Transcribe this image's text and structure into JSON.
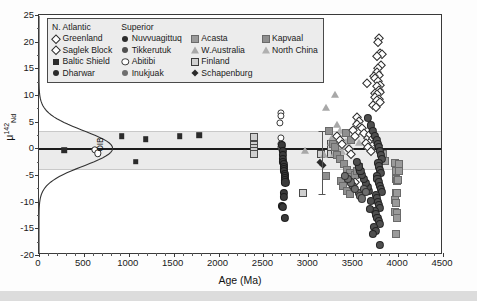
{
  "chart_data": {
    "type": "scatter",
    "title": "",
    "xlabel": "Age (Ma)",
    "ylabel": "μ142Nd",
    "ylabel_parts": {
      "mu": "μ",
      "sup": "142",
      "sub": "Nd"
    },
    "xlim": [
      0,
      4500
    ],
    "ylim": [
      -20,
      25
    ],
    "xticks": [
      0,
      500,
      1000,
      1500,
      2000,
      2500,
      3000,
      3500,
      4000,
      4500
    ],
    "xtick_labels": [
      "0",
      "500",
      "1000",
      "1500",
      "2000",
      "2500",
      "3000",
      "3500",
      "4000",
      "4500"
    ],
    "yticks": [
      -20,
      -15,
      -10,
      -5,
      0,
      5,
      10,
      15,
      20,
      25
    ],
    "ytick_labels": [
      "-20",
      "-15",
      "-10",
      "-5",
      "0",
      "5",
      "10",
      "15",
      "20",
      "25"
    ],
    "grid": false,
    "zero_line": 0,
    "reference_band": {
      "label": "modern mantle band",
      "upper": 3.3,
      "lower": -3.8,
      "color": "#e8e8e8"
    },
    "annotations": [
      {
        "text": "OIB",
        "x": 700,
        "y": 0.2,
        "rotation": -90
      }
    ],
    "error_bar": {
      "x": 3150,
      "y": -3.0,
      "upper": 3.3,
      "lower": -8.6
    },
    "density_curve": {
      "name": "OIB distribution",
      "description": "Gaussian kernel density of modern OIB plotted sideways at left axis, peak near 800 Ma equivalent width centred on mu = 0",
      "center": 0.0,
      "sigma": 3.3,
      "peak_x": 820
    },
    "legend": {
      "position": "upper-left-inside",
      "columns": [
        {
          "header": "N. Atlantic",
          "items": [
            {
              "label": "Greenland",
              "marker": "diamond-open",
              "color": "#ffffff",
              "edge": "#2b2b2b"
            },
            {
              "label": "Saglek Block",
              "marker": "diamond-open",
              "color": "#ffffff",
              "edge": "#2b2b2b"
            },
            {
              "label": "Baltic Shield",
              "marker": "square-filled",
              "color": "#2b2b2b",
              "edge": "#2b2b2b"
            },
            {
              "label": "Dharwar",
              "marker": "circle-filled",
              "color": "#2b2b2b",
              "edge": "#2b2b2b"
            }
          ]
        },
        {
          "header": "Superior",
          "items": [
            {
              "label": "Nuvvuagittuq",
              "marker": "circle-filled",
              "color": "#2b2b2b",
              "edge": "#2b2b2b"
            },
            {
              "label": "Tikkerutuk",
              "marker": "circle-filled",
              "color": "#4f4f4f",
              "edge": "#3a3a3a"
            },
            {
              "label": "Abitibi",
              "marker": "circle-open",
              "color": "#ffffff",
              "edge": "#3a3a3a"
            },
            {
              "label": "Inukjuak",
              "marker": "circle-filled",
              "color": "#6e6e6e",
              "edge": "#4a4a4a"
            }
          ]
        },
        {
          "header": "",
          "items": [
            {
              "label": "Acasta",
              "marker": "square-gray",
              "color": "#9a9a9a",
              "edge": "#6a6a6a"
            },
            {
              "label": "W.Australia",
              "marker": "triangle-gray",
              "color": "#a8a8a8",
              "edge": "#7a7a7a"
            },
            {
              "label": "Finland",
              "marker": "square-hatched",
              "color": "#cfcfcf",
              "edge": "#4a4a4a"
            },
            {
              "label": "Schapenburg",
              "marker": "diamond-filled",
              "color": "#2b2b2b",
              "edge": "#2b2b2b"
            }
          ]
        },
        {
          "header": "",
          "items": [
            {
              "label": "Kapvaal",
              "marker": "square-gray",
              "color": "#8f8f8f",
              "edge": "#6a6a6a"
            },
            {
              "label": "North China",
              "marker": "triangle-gray",
              "color": "#b0b0b0",
              "edge": "#7a7a7a"
            }
          ]
        }
      ]
    },
    "series": [
      {
        "name": "Baltic Shield",
        "marker": "square-filled",
        "color": "#2b2b2b",
        "points": [
          [
            283,
            -0.4
          ],
          [
            920,
            2.3
          ],
          [
            1190,
            1.7
          ],
          [
            1565,
            2.3
          ],
          [
            1785,
            2.5
          ],
          [
            1075,
            -2.5
          ]
        ]
      },
      {
        "name": "Dharwar",
        "marker": "circle-open-small",
        "color": "#ffffff",
        "points": [
          [
            620,
            -0.3
          ],
          [
            655,
            -0.9
          ]
        ]
      },
      {
        "name": "Finland",
        "marker": "square-hatched",
        "color": "#cfcfcf",
        "points": [
          [
            2395,
            2.2
          ],
          [
            2395,
            0.7
          ],
          [
            2395,
            0.1
          ],
          [
            2400,
            -0.5
          ],
          [
            2400,
            -1.0
          ],
          [
            2940,
            -8.3
          ],
          [
            3250,
            0.9
          ],
          [
            3250,
            -0.1
          ],
          [
            3255,
            -1.1
          ],
          [
            3140,
            -1.1
          ],
          [
            3300,
            0.4
          ],
          [
            3300,
            -0.6
          ]
        ]
      },
      {
        "name": "Abitibi",
        "marker": "circle-open",
        "color": "#ffffff",
        "points": [
          [
            2690,
            6.6
          ],
          [
            2690,
            6.1
          ],
          [
            2685,
            4.7
          ],
          [
            2690,
            2.0
          ],
          [
            2695,
            0.9
          ],
          [
            2700,
            0.3
          ],
          [
            2705,
            -0.2
          ]
        ]
      },
      {
        "name": "Nuvvuagittuq",
        "marker": "circle-filled",
        "color": "#3a3a3a",
        "points": [
          [
            2710,
            0.6
          ],
          [
            2715,
            -0.5
          ],
          [
            2715,
            -1.3
          ],
          [
            2720,
            -2.0
          ],
          [
            2720,
            -2.6
          ],
          [
            2725,
            -3.0
          ],
          [
            2725,
            -3.5
          ],
          [
            2730,
            -3.9
          ],
          [
            2730,
            -4.3
          ],
          [
            2735,
            -4.8
          ],
          [
            2735,
            -5.2
          ],
          [
            2740,
            -5.6
          ],
          [
            2740,
            -6.0
          ],
          [
            2745,
            -6.4
          ],
          [
            2725,
            -8.4
          ],
          [
            2725,
            -9.1
          ],
          [
            2710,
            -10.8
          ],
          [
            2720,
            -11.0
          ],
          [
            2735,
            -13.1
          ]
        ]
      },
      {
        "name": "W.Australia",
        "marker": "triangle-gray",
        "color": "#a8a8a8",
        "points": [
          [
            3300,
            10.0
          ],
          [
            3200,
            7.5
          ],
          [
            3320,
            4.3
          ],
          [
            3260,
            2.0
          ],
          [
            3250,
            1.0
          ],
          [
            3330,
            -0.5
          ],
          [
            3290,
            -1.1
          ],
          [
            3180,
            -1.2
          ],
          [
            3345,
            -1.0
          ],
          [
            2960,
            -0.5
          ]
        ]
      },
      {
        "name": "North China",
        "marker": "triangle-gray",
        "color": "#b0b0b0",
        "points": [
          [
            3350,
            3.2
          ],
          [
            3360,
            1.4
          ],
          [
            3370,
            0.3
          ],
          [
            3380,
            -0.7
          ],
          [
            3420,
            1.2
          ],
          [
            3450,
            0.4
          ],
          [
            3500,
            2.2
          ],
          [
            3560,
            1.0
          ]
        ]
      },
      {
        "name": "Acasta",
        "marker": "square-gray",
        "color": "#9a9a9a",
        "points": [
          [
            3960,
            -2.8
          ],
          [
            3975,
            -4.2
          ],
          [
            3980,
            -5.8
          ],
          [
            3985,
            -6.2
          ],
          [
            4000,
            -6.0
          ],
          [
            3975,
            -8.4
          ],
          [
            3990,
            -8.3
          ],
          [
            3970,
            -9.6
          ],
          [
            3975,
            -10.3
          ],
          [
            3970,
            -12.0
          ],
          [
            3990,
            -12.1
          ],
          [
            3985,
            -13.0
          ],
          [
            3975,
            -16.0
          ],
          [
            4010,
            -4.2
          ],
          [
            4005,
            -3.0
          ],
          [
            3830,
            -1.0
          ],
          [
            3850,
            -2.4
          ]
        ]
      },
      {
        "name": "Kapvaal",
        "marker": "square-gray",
        "color": "#8f8f8f",
        "points": [
          [
            3200,
            -5.1
          ],
          [
            3280,
            0.9
          ],
          [
            3300,
            0.2
          ],
          [
            3320,
            -1.2
          ],
          [
            3350,
            -2.0
          ],
          [
            3400,
            -3.0
          ],
          [
            3430,
            -4.0
          ],
          [
            3460,
            -4.6
          ],
          [
            3480,
            -5.4
          ],
          [
            3500,
            -6.0
          ],
          [
            3520,
            -5.0
          ],
          [
            3540,
            -4.3
          ],
          [
            3560,
            -3.5
          ],
          [
            3230,
            3.2
          ],
          [
            3420,
            2.8
          ],
          [
            3470,
            1.6
          ],
          [
            3360,
            -6.2
          ],
          [
            3390,
            -7.0
          ],
          [
            3430,
            -8.0
          ],
          [
            3460,
            -8.6
          ]
        ]
      },
      {
        "name": "Greenland",
        "marker": "diamond-open",
        "color": "#ffffff",
        "points": [
          [
            3790,
            20.6
          ],
          [
            3775,
            20.0
          ],
          [
            3800,
            17.8
          ],
          [
            3815,
            17.6
          ],
          [
            3760,
            17.3
          ],
          [
            3810,
            15.6
          ],
          [
            3780,
            15.1
          ],
          [
            3760,
            14.3
          ],
          [
            3790,
            13.8
          ],
          [
            3735,
            13.5
          ],
          [
            3745,
            13.2
          ],
          [
            3780,
            12.6
          ],
          [
            3650,
            12.2
          ],
          [
            3800,
            11.9
          ],
          [
            3760,
            11.6
          ],
          [
            3790,
            11.0
          ],
          [
            3800,
            10.6
          ],
          [
            3740,
            10.4
          ],
          [
            3770,
            10.2
          ],
          [
            3745,
            9.6
          ],
          [
            3790,
            9.3
          ],
          [
            3760,
            9.0
          ],
          [
            3800,
            8.6
          ],
          [
            3720,
            8.2
          ],
          [
            3755,
            7.8
          ],
          [
            3545,
            5.9
          ],
          [
            3560,
            5.2
          ],
          [
            3540,
            4.6
          ],
          [
            3570,
            4.0
          ],
          [
            3550,
            3.3
          ],
          [
            3500,
            3.5
          ],
          [
            3520,
            2.4
          ],
          [
            3600,
            3.8
          ],
          [
            3620,
            2.8
          ],
          [
            3660,
            2.0
          ],
          [
            3700,
            1.4
          ],
          [
            3730,
            0.9
          ],
          [
            3450,
            -0.2
          ],
          [
            3480,
            -1.0
          ],
          [
            3515,
            -6.3
          ]
        ]
      },
      {
        "name": "Saglek Block",
        "marker": "diamond-open",
        "color": "#ffffff",
        "points": [
          [
            3690,
            2.6
          ],
          [
            3720,
            2.0
          ],
          [
            3750,
            1.3
          ],
          [
            3780,
            0.7
          ],
          [
            3640,
            1.0
          ],
          [
            3670,
            0.2
          ],
          [
            3700,
            -0.5
          ],
          [
            3320,
            2.4
          ],
          [
            3350,
            1.5
          ],
          [
            3380,
            0.9
          ]
        ]
      },
      {
        "name": "Tikkerutuk",
        "marker": "circle-filled",
        "color": "#4f4f4f",
        "points": [
          [
            3660,
            5.7
          ],
          [
            3700,
            4.3
          ],
          [
            3720,
            3.2
          ],
          [
            3745,
            2.4
          ],
          [
            3760,
            1.6
          ],
          [
            3775,
            0.9
          ],
          [
            3790,
            0.2
          ],
          [
            3800,
            -0.5
          ],
          [
            3810,
            -1.2
          ],
          [
            3820,
            -2.0
          ],
          [
            3780,
            -2.8
          ],
          [
            3790,
            -3.4
          ],
          [
            3800,
            -4.0
          ],
          [
            3810,
            -4.6
          ],
          [
            3760,
            -5.2
          ],
          [
            3770,
            -5.8
          ],
          [
            3785,
            -6.4
          ],
          [
            3795,
            -7.0
          ],
          [
            3805,
            -7.6
          ],
          [
            3815,
            -8.2
          ],
          [
            3750,
            -8.8
          ],
          [
            3765,
            -9.4
          ],
          [
            3775,
            -10.0
          ],
          [
            3790,
            -10.6
          ],
          [
            3800,
            -11.2
          ],
          [
            3740,
            -11.8
          ],
          [
            3755,
            -12.4
          ],
          [
            3770,
            -13.0
          ],
          [
            3785,
            -13.6
          ],
          [
            3795,
            -14.2
          ],
          [
            3730,
            -14.8
          ],
          [
            3750,
            -15.5
          ],
          [
            3715,
            -16.1
          ],
          [
            3800,
            -18.1
          ],
          [
            3700,
            -9.8
          ],
          [
            3690,
            -11.3
          ],
          [
            3675,
            -8.0
          ],
          [
            3660,
            -7.2
          ],
          [
            3640,
            -6.5
          ],
          [
            3620,
            -5.8
          ],
          [
            3600,
            -5.0
          ],
          [
            3580,
            -4.2
          ],
          [
            3560,
            -3.4
          ],
          [
            3545,
            -2.6
          ]
        ]
      },
      {
        "name": "Inukjuak",
        "marker": "circle-filled",
        "color": "#6e6e6e",
        "points": [
          [
            3560,
            -8.4
          ],
          [
            3580,
            -8.9
          ],
          [
            3600,
            -9.4
          ],
          [
            3620,
            -7.6
          ],
          [
            3640,
            -8.2
          ],
          [
            3500,
            -7.0
          ],
          [
            3520,
            -7.6
          ],
          [
            3470,
            -6.4
          ],
          [
            3440,
            -5.8
          ],
          [
            3410,
            -5.2
          ]
        ]
      },
      {
        "name": "Schapenburg",
        "marker": "diamond-filled",
        "color": "#2b2b2b",
        "points": [
          [
            3130,
            -2.6
          ],
          [
            3160,
            -3.2
          ]
        ]
      }
    ]
  }
}
